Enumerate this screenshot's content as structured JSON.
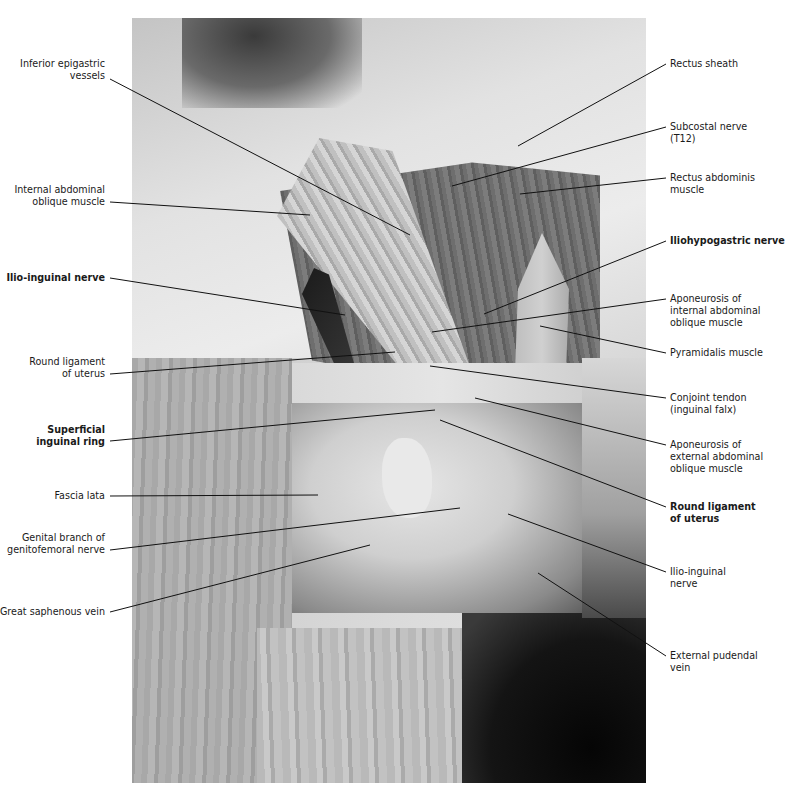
{
  "figure": {
    "type": "anatomical dissection photograph",
    "photo_tone": "grayscale"
  },
  "labels_left": [
    {
      "id": "inferior-epigastric-vessels",
      "lines": [
        "Inferior epigastric",
        "vessels"
      ],
      "bold": false,
      "x": 105,
      "y": 58
    },
    {
      "id": "internal-abdominal-oblique-muscle",
      "lines": [
        "Internal abdominal",
        "oblique muscle"
      ],
      "bold": false,
      "x": 105,
      "y": 184
    },
    {
      "id": "ilio-inguinal-nerve-left",
      "lines": [
        "Ilio-inguinal nerve"
      ],
      "bold": true,
      "x": 105,
      "y": 272
    },
    {
      "id": "round-ligament-of-uterus-left",
      "lines": [
        "Round ligament",
        "of uterus"
      ],
      "bold": false,
      "x": 105,
      "y": 356
    },
    {
      "id": "superficial-inguinal-ring",
      "lines": [
        "Superficial",
        "inguinal ring"
      ],
      "bold": true,
      "x": 105,
      "y": 424
    },
    {
      "id": "fascia-lata",
      "lines": [
        "Fascia lata"
      ],
      "bold": false,
      "x": 105,
      "y": 490
    },
    {
      "id": "genital-branch-genitofemoral-nerve",
      "lines": [
        "Genital branch of",
        "genitofemoral nerve"
      ],
      "bold": false,
      "x": 105,
      "y": 532
    },
    {
      "id": "great-saphenous-vein",
      "lines": [
        "Great saphenous vein"
      ],
      "bold": false,
      "x": 105,
      "y": 606
    }
  ],
  "labels_right": [
    {
      "id": "rectus-sheath",
      "lines": [
        "Rectus sheath"
      ],
      "bold": false,
      "x": 670,
      "y": 58
    },
    {
      "id": "subcostal-nerve",
      "lines": [
        "Subcostal nerve",
        "(T12)"
      ],
      "bold": false,
      "x": 670,
      "y": 121
    },
    {
      "id": "rectus-abdominis-muscle",
      "lines": [
        "Rectus abdominis",
        "muscle"
      ],
      "bold": false,
      "x": 670,
      "y": 172
    },
    {
      "id": "iliohypogastric-nerve",
      "lines": [
        "Iliohypogastric nerve"
      ],
      "bold": true,
      "x": 670,
      "y": 235
    },
    {
      "id": "aponeurosis-internal-oblique",
      "lines": [
        "Aponeurosis of",
        "internal abdominal",
        "oblique muscle"
      ],
      "bold": false,
      "x": 670,
      "y": 293
    },
    {
      "id": "pyramidalis-muscle",
      "lines": [
        "Pyramidalis muscle"
      ],
      "bold": false,
      "x": 670,
      "y": 347
    },
    {
      "id": "conjoint-tendon",
      "lines": [
        "Conjoint tendon",
        "(inguinal falx)"
      ],
      "bold": false,
      "x": 670,
      "y": 392
    },
    {
      "id": "aponeurosis-external-oblique",
      "lines": [
        "Aponeurosis of",
        "external abdominal",
        "oblique muscle"
      ],
      "bold": false,
      "x": 670,
      "y": 439
    },
    {
      "id": "round-ligament-of-uterus-right",
      "lines": [
        "Round ligament",
        "of uterus"
      ],
      "bold": true,
      "x": 670,
      "y": 501
    },
    {
      "id": "ilio-inguinal-nerve-right",
      "lines": [
        "Ilio-inguinal",
        "nerve"
      ],
      "bold": false,
      "x": 670,
      "y": 566
    },
    {
      "id": "external-pudendal-vein",
      "lines": [
        "External pudendal",
        "vein"
      ],
      "bold": false,
      "x": 670,
      "y": 650
    }
  ],
  "leader_lines": [
    {
      "for": "inferior-epigastric-vessels",
      "x1": 110,
      "y1": 79,
      "x2": 410,
      "y2": 235
    },
    {
      "for": "internal-abdominal-oblique-muscle",
      "x1": 110,
      "y1": 202,
      "x2": 310,
      "y2": 215
    },
    {
      "for": "ilio-inguinal-nerve-left",
      "x1": 110,
      "y1": 278,
      "x2": 345,
      "y2": 315
    },
    {
      "for": "round-ligament-of-uterus-left",
      "x1": 110,
      "y1": 374,
      "x2": 395,
      "y2": 352
    },
    {
      "for": "superficial-inguinal-ring",
      "x1": 110,
      "y1": 441,
      "x2": 435,
      "y2": 410
    },
    {
      "for": "fascia-lata",
      "x1": 110,
      "y1": 496,
      "x2": 318,
      "y2": 495
    },
    {
      "for": "genital-branch-genitofemoral-nerve",
      "x1": 110,
      "y1": 550,
      "x2": 460,
      "y2": 508
    },
    {
      "for": "great-saphenous-vein",
      "x1": 110,
      "y1": 612,
      "x2": 370,
      "y2": 545
    },
    {
      "for": "rectus-sheath",
      "x1": 666,
      "y1": 64,
      "x2": 518,
      "y2": 146
    },
    {
      "for": "subcostal-nerve",
      "x1": 666,
      "y1": 127,
      "x2": 452,
      "y2": 186
    },
    {
      "for": "rectus-abdominis-muscle",
      "x1": 666,
      "y1": 178,
      "x2": 520,
      "y2": 194
    },
    {
      "for": "iliohypogastric-nerve",
      "x1": 666,
      "y1": 241,
      "x2": 484,
      "y2": 314
    },
    {
      "for": "aponeurosis-internal-oblique",
      "x1": 666,
      "y1": 299,
      "x2": 432,
      "y2": 332
    },
    {
      "for": "pyramidalis-muscle",
      "x1": 666,
      "y1": 353,
      "x2": 540,
      "y2": 326
    },
    {
      "for": "conjoint-tendon",
      "x1": 666,
      "y1": 398,
      "x2": 430,
      "y2": 366
    },
    {
      "for": "aponeurosis-external-oblique",
      "x1": 666,
      "y1": 445,
      "x2": 475,
      "y2": 398
    },
    {
      "for": "round-ligament-of-uterus-right",
      "x1": 666,
      "y1": 507,
      "x2": 440,
      "y2": 420
    },
    {
      "for": "ilio-inguinal-nerve-right",
      "x1": 666,
      "y1": 572,
      "x2": 508,
      "y2": 514
    },
    {
      "for": "external-pudendal-vein",
      "x1": 666,
      "y1": 656,
      "x2": 538,
      "y2": 573
    }
  ]
}
